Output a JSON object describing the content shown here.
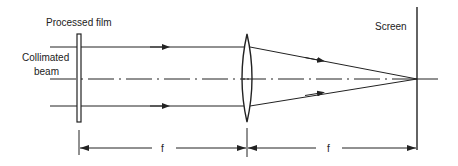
{
  "diagram": {
    "labels": {
      "film": "Processed film",
      "beam_line1": "Collimated",
      "beam_line2": "beam",
      "screen": "Screen",
      "focal_1": "f",
      "focal_2": "f"
    },
    "elements": [
      {
        "id": "film",
        "type": "plate",
        "x": 79,
        "y_top": 34,
        "y_bottom": 122
      },
      {
        "id": "lens",
        "type": "biconvex-lens",
        "x": 247,
        "y_top": 34,
        "y_bottom": 122
      },
      {
        "id": "screen",
        "type": "screen",
        "x": 417,
        "y_top": 7,
        "y_bottom": 150
      }
    ],
    "optical_axis_y": 79,
    "rays": [
      {
        "name": "upper-ray",
        "y": 47,
        "converges_to": [
          417,
          79
        ]
      },
      {
        "name": "lower-ray",
        "y": 106,
        "converges_to": [
          417,
          79
        ]
      }
    ],
    "dimensions": [
      {
        "label": "f",
        "from": "film",
        "to": "lens"
      },
      {
        "label": "f",
        "from": "lens",
        "to": "screen"
      }
    ],
    "colors": {
      "ink": "#222222",
      "background": "#ffffff"
    }
  }
}
